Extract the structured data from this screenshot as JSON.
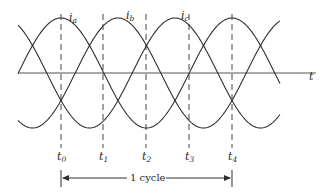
{
  "diagram": {
    "axis_label": "t",
    "curves": [
      {
        "name": "i",
        "sub": "a",
        "peak_x": 61
      },
      {
        "name": "i",
        "sub": "b",
        "peak_x": 118
      },
      {
        "name": "i",
        "sub": "c",
        "peak_x": 175
      }
    ],
    "time_marks": [
      {
        "name": "t",
        "sub": "0",
        "x": 61
      },
      {
        "name": "t",
        "sub": "1",
        "x": 103
      },
      {
        "name": "t",
        "sub": "2",
        "x": 146
      },
      {
        "name": "t",
        "sub": "3",
        "x": 189
      },
      {
        "name": "t",
        "sub": "4",
        "x": 232
      }
    ],
    "cycle_label": "1 cycle",
    "colors": {
      "line": "#2e2e2e",
      "background": "#ffffff"
    }
  }
}
